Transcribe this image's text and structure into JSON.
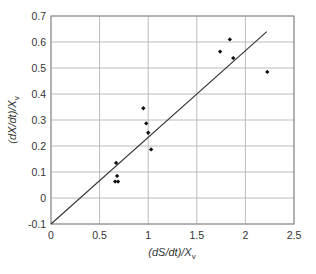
{
  "chart_data": {
    "type": "scatter",
    "title": "",
    "xlabel": "(dS/dt)/X_v",
    "ylabel": "(dX/dt)/X_v",
    "xlabel_parts": {
      "main": "(dS/dt)/X",
      "sub": "v"
    },
    "ylabel_parts": {
      "main": "(dX/dt)/X",
      "sub": "v"
    },
    "xlim": [
      0,
      2.5
    ],
    "ylim": [
      -0.1,
      0.7
    ],
    "x_ticks": [
      0,
      0.5,
      1,
      1.5,
      2,
      2.5
    ],
    "x_tick_labels": [
      "0",
      "0.5",
      "1",
      "1.5",
      "2",
      "2.5"
    ],
    "y_ticks": [
      -0.1,
      0,
      0.1,
      0.2,
      0.3,
      0.4,
      0.5,
      0.6,
      0.7
    ],
    "y_tick_labels": [
      "-0.1",
      "0",
      "0.1",
      "0.2",
      "0.3",
      "0.4",
      "0.5",
      "0.6",
      "0.7"
    ],
    "grid": true,
    "legend": null,
    "series": [
      {
        "name": "data",
        "marker": "diamond",
        "points": [
          {
            "x": 0.67,
            "y": 0.135
          },
          {
            "x": 0.68,
            "y": 0.085
          },
          {
            "x": 0.66,
            "y": 0.063
          },
          {
            "x": 0.69,
            "y": 0.063
          },
          {
            "x": 0.95,
            "y": 0.345
          },
          {
            "x": 0.98,
            "y": 0.287
          },
          {
            "x": 1.0,
            "y": 0.251
          },
          {
            "x": 1.03,
            "y": 0.187
          },
          {
            "x": 1.74,
            "y": 0.563
          },
          {
            "x": 1.84,
            "y": 0.61
          },
          {
            "x": 1.875,
            "y": 0.538
          },
          {
            "x": 2.225,
            "y": 0.485
          }
        ]
      }
    ],
    "trendline": {
      "name": "linear fit",
      "x": [
        0,
        2.22
      ],
      "y": [
        -0.1,
        0.64
      ]
    },
    "colors": {
      "points": "#111111",
      "line": "#333333",
      "grid": "#bbbbbb",
      "frame": "#888888"
    }
  }
}
